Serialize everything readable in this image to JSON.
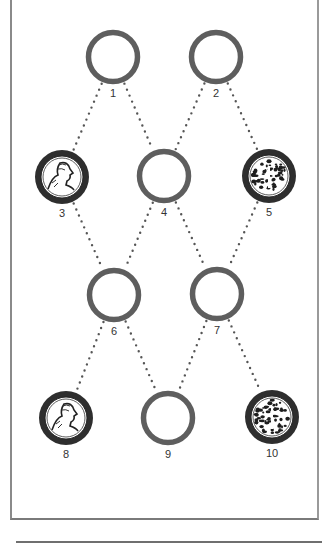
{
  "diagram": {
    "colors": {
      "ring": "#5e5e5e",
      "dot": "#555555",
      "frame": "#8a8a8a"
    },
    "nodes": [
      {
        "id": 1,
        "label": "1",
        "x": 113,
        "y": 57,
        "coin": "empty"
      },
      {
        "id": 2,
        "label": "2",
        "x": 216,
        "y": 57,
        "coin": "empty"
      },
      {
        "id": 3,
        "label": "3",
        "x": 62,
        "y": 177,
        "coin": "penny"
      },
      {
        "id": 4,
        "label": "4",
        "x": 164,
        "y": 176,
        "coin": "empty"
      },
      {
        "id": 5,
        "label": "5",
        "x": 269,
        "y": 176,
        "coin": "dime"
      },
      {
        "id": 6,
        "label": "6",
        "x": 114,
        "y": 295,
        "coin": "empty"
      },
      {
        "id": 7,
        "label": "7",
        "x": 217,
        "y": 294,
        "coin": "empty"
      },
      {
        "id": 8,
        "label": "8",
        "x": 66,
        "y": 418,
        "coin": "penny"
      },
      {
        "id": 9,
        "label": "9",
        "x": 168,
        "y": 418,
        "coin": "empty"
      },
      {
        "id": 10,
        "label": "10",
        "x": 272,
        "y": 417,
        "coin": "dime"
      }
    ],
    "edges": [
      [
        1,
        3
      ],
      [
        1,
        4
      ],
      [
        2,
        4
      ],
      [
        2,
        5
      ],
      [
        3,
        6
      ],
      [
        4,
        6
      ],
      [
        4,
        7
      ],
      [
        5,
        7
      ],
      [
        6,
        8
      ],
      [
        6,
        9
      ],
      [
        7,
        9
      ],
      [
        7,
        10
      ]
    ]
  }
}
